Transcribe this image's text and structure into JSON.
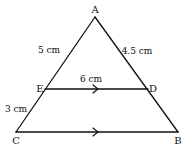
{
  "diagram": {
    "type": "geometry-triangle",
    "vertices": {
      "A": {
        "label": "A",
        "x": 95,
        "y": 17
      },
      "B": {
        "label": "B",
        "x": 178,
        "y": 132
      },
      "C": {
        "label": "C",
        "x": 16,
        "y": 132
      },
      "D": {
        "label": "D",
        "x": 148,
        "y": 89
      },
      "E": {
        "label": "E",
        "x": 45,
        "y": 89
      }
    },
    "measurements": {
      "AE": "5 cm",
      "AD": "4.5 cm",
      "ED": "6 cm",
      "EC": "3 cm"
    },
    "parallel_marks": [
      "ED",
      "CB"
    ],
    "colors": {
      "line": "#111111",
      "background": "#ffffff"
    }
  }
}
